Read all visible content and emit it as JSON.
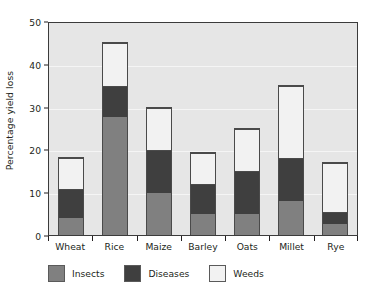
{
  "chart_data": {
    "type": "bar",
    "subtype": "stacked-vertical",
    "title": "",
    "xlabel": "",
    "ylabel": "Percentage yield loss",
    "ylim": [
      0,
      50
    ],
    "yticks": [
      0,
      10,
      20,
      30,
      40,
      50
    ],
    "ytick_labels": [
      "0",
      "10",
      "20",
      "30",
      "40",
      "50"
    ],
    "grid": true,
    "grid_axis": "y",
    "legend_position": "below-axes",
    "categories": [
      "Wheat",
      "Rice",
      "Maize",
      "Barley",
      "Oats",
      "Millet",
      "Rye"
    ],
    "series": [
      {
        "name": "Insects",
        "color": "#808080",
        "values": [
          4.0,
          27.8,
          10.0,
          5.0,
          5.0,
          8.0,
          2.5
        ]
      },
      {
        "name": "Diseases",
        "color": "#3f3f3f",
        "values": [
          7.0,
          7.2,
          10.0,
          7.0,
          10.0,
          10.0,
          3.0
        ]
      },
      {
        "name": "Weeds",
        "color": "#f2f2f2",
        "values": [
          7.3,
          10.0,
          10.0,
          7.5,
          10.0,
          17.0,
          11.5
        ]
      }
    ],
    "cumulative_tops": [
      [
        4.0,
        11.0,
        18.3
      ],
      [
        27.8,
        35.0,
        45.0
      ],
      [
        10.0,
        20.0,
        30.0
      ],
      [
        5.0,
        12.0,
        19.5
      ],
      [
        5.0,
        15.0,
        25.0
      ],
      [
        8.0,
        18.0,
        35.0
      ],
      [
        2.5,
        5.5,
        17.0
      ]
    ],
    "totals": [
      18.3,
      45.0,
      30.0,
      19.5,
      25.0,
      35.0,
      17.0
    ],
    "plot_background": "#e6e6e6",
    "gridline_color": "#f5f5f5",
    "axis_color": "#3b3b3b",
    "text_color": "#231f20"
  },
  "legend": {
    "items": [
      {
        "label": "Insects",
        "color": "#808080"
      },
      {
        "label": "Diseases",
        "color": "#3f3f3f"
      },
      {
        "label": "Weeds",
        "color": "#f2f2f2"
      }
    ]
  }
}
